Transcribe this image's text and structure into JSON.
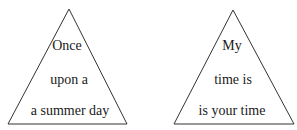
{
  "triangles": [
    {
      "lines": [
        "Once",
        "upon a",
        "a summer day"
      ],
      "apex": [
        69,
        9
      ],
      "base_left": [
        8,
        124
      ],
      "base_right": [
        127,
        124
      ]
    },
    {
      "lines": [
        "My",
        "time is",
        "is your time"
      ],
      "apex": [
        233,
        10
      ],
      "base_left": [
        174,
        124
      ],
      "base_right": [
        294,
        124
      ]
    }
  ],
  "colors": {
    "stroke": "#333333",
    "text": "#1a1a1a",
    "background": "#ffffff"
  }
}
